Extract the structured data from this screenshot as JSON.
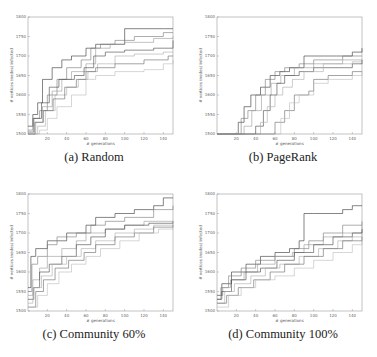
{
  "figure": {
    "panels": [
      {
        "id": "a",
        "caption": "(a) Random"
      },
      {
        "id": "b",
        "caption": "(b) PageRank"
      },
      {
        "id": "c",
        "caption": "(c) Community 60%"
      },
      {
        "id": "d",
        "caption": "(d) Community 100%"
      }
    ]
  },
  "chart_data": [
    {
      "type": "line",
      "title": "(a) Random",
      "xlabel": "# generations",
      "ylabel": "# vertices (nodes) infected",
      "xlim": [
        0,
        150
      ],
      "ylim": [
        1500,
        1800
      ],
      "xticks": [
        20,
        40,
        60,
        80,
        100,
        120,
        140
      ],
      "yticks": [
        1500,
        1550,
        1600,
        1650,
        1700,
        1750,
        1800
      ],
      "grid": false,
      "color": "#555555",
      "series": [
        {
          "name": "run1",
          "x": [
            0,
            5,
            10,
            15,
            25,
            35,
            45,
            60,
            70,
            80,
            100,
            140,
            150
          ],
          "y": [
            1520,
            1550,
            1580,
            1640,
            1670,
            1690,
            1700,
            1720,
            1730,
            1730,
            1770,
            1770,
            1770
          ]
        },
        {
          "name": "run2",
          "x": [
            0,
            5,
            12,
            20,
            30,
            40,
            55,
            65,
            75,
            90,
            110,
            140,
            150
          ],
          "y": [
            1510,
            1540,
            1560,
            1600,
            1640,
            1670,
            1690,
            1720,
            1730,
            1740,
            1750,
            1760,
            1760
          ]
        },
        {
          "name": "run3",
          "x": [
            0,
            8,
            15,
            25,
            35,
            45,
            60,
            70,
            85,
            100,
            130,
            150
          ],
          "y": [
            1500,
            1530,
            1570,
            1610,
            1640,
            1660,
            1680,
            1720,
            1730,
            1735,
            1745,
            1750
          ]
        },
        {
          "name": "run4",
          "x": [
            0,
            6,
            14,
            22,
            32,
            48,
            58,
            68,
            80,
            100,
            130,
            150
          ],
          "y": [
            1505,
            1540,
            1580,
            1620,
            1640,
            1650,
            1670,
            1700,
            1710,
            1715,
            1720,
            1740
          ]
        },
        {
          "name": "run5",
          "x": [
            0,
            10,
            18,
            28,
            40,
            52,
            62,
            72,
            90,
            110,
            140,
            150
          ],
          "y": [
            1500,
            1520,
            1560,
            1600,
            1620,
            1640,
            1660,
            1680,
            1700,
            1705,
            1710,
            1710
          ]
        },
        {
          "name": "run6",
          "x": [
            0,
            7,
            16,
            26,
            38,
            50,
            60,
            70,
            90,
            120,
            145,
            150
          ],
          "y": [
            1500,
            1530,
            1560,
            1590,
            1620,
            1640,
            1660,
            1670,
            1680,
            1690,
            1700,
            1700
          ]
        },
        {
          "name": "run7",
          "x": [
            0,
            12,
            20,
            30,
            45,
            60,
            70,
            90,
            120,
            140,
            150
          ],
          "y": [
            1500,
            1510,
            1540,
            1570,
            1600,
            1640,
            1650,
            1660,
            1665,
            1680,
            1690
          ]
        }
      ]
    },
    {
      "type": "line",
      "title": "(b) PageRank",
      "xlabel": "# generations",
      "ylabel": "# vertices (nodes) infected",
      "xlim": [
        0,
        150
      ],
      "ylim": [
        1500,
        1800
      ],
      "xticks": [
        20,
        40,
        60,
        80,
        100,
        120,
        140
      ],
      "yticks": [
        1500,
        1550,
        1600,
        1650,
        1700,
        1750,
        1800
      ],
      "grid": false,
      "color": "#555555",
      "series": [
        {
          "name": "run1",
          "x": [
            0,
            18,
            22,
            28,
            35,
            45,
            55,
            65,
            75,
            90,
            110,
            140,
            150
          ],
          "y": [
            1500,
            1500,
            1530,
            1570,
            1600,
            1620,
            1650,
            1660,
            1670,
            1700,
            1700,
            1710,
            1720
          ]
        },
        {
          "name": "run2",
          "x": [
            0,
            20,
            25,
            32,
            40,
            50,
            60,
            70,
            85,
            100,
            130,
            150
          ],
          "y": [
            1500,
            1500,
            1540,
            1560,
            1600,
            1640,
            1660,
            1670,
            1680,
            1690,
            1700,
            1700
          ]
        },
        {
          "name": "run3",
          "x": [
            0,
            22,
            28,
            36,
            46,
            56,
            66,
            80,
            100,
            130,
            150
          ],
          "y": [
            1500,
            1500,
            1520,
            1560,
            1600,
            1630,
            1650,
            1670,
            1680,
            1690,
            1690
          ]
        },
        {
          "name": "run4",
          "x": [
            0,
            35,
            40,
            48,
            55,
            62,
            70,
            85,
            100,
            140,
            150
          ],
          "y": [
            1500,
            1500,
            1520,
            1560,
            1600,
            1630,
            1650,
            1660,
            1670,
            1680,
            1690
          ]
        },
        {
          "name": "run5",
          "x": [
            0,
            40,
            45,
            52,
            60,
            68,
            78,
            90,
            110,
            140,
            150
          ],
          "y": [
            1500,
            1500,
            1530,
            1570,
            1600,
            1620,
            1640,
            1660,
            1680,
            1685,
            1690
          ]
        },
        {
          "name": "run6",
          "x": [
            0,
            55,
            60,
            70,
            80,
            95,
            100,
            115,
            140,
            150
          ],
          "y": [
            1500,
            1500,
            1530,
            1560,
            1600,
            1610,
            1640,
            1650,
            1660,
            1660
          ]
        },
        {
          "name": "run7",
          "x": [
            0,
            60,
            66,
            75,
            85,
            100,
            115,
            140,
            150
          ],
          "y": [
            1500,
            1500,
            1540,
            1580,
            1600,
            1630,
            1640,
            1650,
            1660
          ]
        }
      ]
    },
    {
      "type": "line",
      "title": "(c) Community 60%",
      "xlabel": "# generations",
      "ylabel": "# vertices (nodes) infected",
      "xlim": [
        0,
        150
      ],
      "ylim": [
        1500,
        1800
      ],
      "xticks": [
        20,
        40,
        60,
        80,
        100,
        120,
        140
      ],
      "yticks": [
        1500,
        1550,
        1600,
        1650,
        1700,
        1750,
        1800
      ],
      "grid": false,
      "color": "#555555",
      "series": [
        {
          "name": "run1",
          "x": [
            0,
            3,
            8,
            20,
            40,
            60,
            70,
            90,
            110,
            130,
            140,
            150
          ],
          "y": [
            1560,
            1640,
            1660,
            1680,
            1700,
            1720,
            1740,
            1750,
            1760,
            1770,
            1790,
            1790
          ]
        },
        {
          "name": "run2",
          "x": [
            0,
            4,
            10,
            20,
            30,
            50,
            65,
            80,
            100,
            130,
            150
          ],
          "y": [
            1550,
            1620,
            1640,
            1670,
            1690,
            1700,
            1720,
            1730,
            1740,
            1760,
            1770
          ]
        },
        {
          "name": "run3",
          "x": [
            0,
            5,
            12,
            20,
            35,
            50,
            60,
            80,
            100,
            120,
            150
          ],
          "y": [
            1540,
            1580,
            1610,
            1640,
            1660,
            1680,
            1700,
            1710,
            1720,
            1730,
            1730
          ]
        },
        {
          "name": "run4",
          "x": [
            0,
            6,
            12,
            22,
            35,
            50,
            65,
            80,
            100,
            125,
            150
          ],
          "y": [
            1530,
            1560,
            1600,
            1620,
            1640,
            1670,
            1690,
            1710,
            1720,
            1725,
            1730
          ]
        },
        {
          "name": "run5",
          "x": [
            0,
            5,
            14,
            25,
            40,
            55,
            70,
            90,
            110,
            130,
            150
          ],
          "y": [
            1520,
            1560,
            1590,
            1620,
            1640,
            1660,
            1680,
            1700,
            1710,
            1720,
            1725
          ]
        },
        {
          "name": "run6",
          "x": [
            0,
            8,
            16,
            28,
            42,
            58,
            70,
            90,
            110,
            130,
            150
          ],
          "y": [
            1510,
            1550,
            1580,
            1610,
            1630,
            1650,
            1670,
            1690,
            1700,
            1715,
            1720
          ]
        },
        {
          "name": "run7",
          "x": [
            0,
            10,
            20,
            32,
            45,
            60,
            75,
            95,
            115,
            135,
            150
          ],
          "y": [
            1510,
            1540,
            1570,
            1600,
            1620,
            1640,
            1660,
            1680,
            1700,
            1710,
            1720
          ]
        }
      ]
    },
    {
      "type": "line",
      "title": "(d) Community 100%",
      "xlabel": "# generations",
      "ylabel": "# vertices (nodes) infected",
      "xlim": [
        0,
        150
      ],
      "ylim": [
        1500,
        1800
      ],
      "xticks": [
        20,
        40,
        60,
        80,
        100,
        120,
        140
      ],
      "yticks": [
        1500,
        1550,
        1600,
        1650,
        1700,
        1750,
        1800
      ],
      "grid": false,
      "color": "#555555",
      "series": [
        {
          "name": "run1",
          "x": [
            0,
            5,
            15,
            30,
            45,
            60,
            75,
            85,
            90,
            100,
            130,
            140,
            150
          ],
          "y": [
            1540,
            1570,
            1600,
            1620,
            1640,
            1650,
            1660,
            1680,
            1750,
            1750,
            1760,
            1770,
            1770
          ]
        },
        {
          "name": "run2",
          "x": [
            0,
            4,
            12,
            25,
            40,
            60,
            80,
            95,
            110,
            130,
            150
          ],
          "y": [
            1530,
            1560,
            1590,
            1610,
            1630,
            1640,
            1660,
            1680,
            1700,
            1720,
            1730
          ]
        },
        {
          "name": "run3",
          "x": [
            0,
            6,
            14,
            28,
            42,
            60,
            78,
            90,
            110,
            130,
            150
          ],
          "y": [
            1540,
            1560,
            1580,
            1600,
            1620,
            1640,
            1650,
            1670,
            1690,
            1700,
            1720
          ]
        },
        {
          "name": "run4",
          "x": [
            0,
            5,
            15,
            30,
            45,
            62,
            80,
            100,
            120,
            140,
            150
          ],
          "y": [
            1530,
            1550,
            1580,
            1600,
            1610,
            1630,
            1650,
            1670,
            1690,
            1700,
            1710
          ]
        },
        {
          "name": "run5",
          "x": [
            0,
            8,
            18,
            35,
            50,
            65,
            85,
            105,
            125,
            140,
            150
          ],
          "y": [
            1520,
            1550,
            1570,
            1590,
            1610,
            1620,
            1640,
            1660,
            1680,
            1690,
            1700
          ]
        },
        {
          "name": "run6",
          "x": [
            0,
            10,
            22,
            38,
            55,
            70,
            90,
            110,
            130,
            150
          ],
          "y": [
            1520,
            1540,
            1560,
            1580,
            1600,
            1620,
            1640,
            1660,
            1680,
            1690
          ]
        },
        {
          "name": "run7",
          "x": [
            0,
            12,
            25,
            40,
            60,
            80,
            100,
            120,
            140,
            150
          ],
          "y": [
            1510,
            1540,
            1560,
            1580,
            1590,
            1610,
            1630,
            1650,
            1670,
            1680
          ]
        }
      ]
    }
  ]
}
